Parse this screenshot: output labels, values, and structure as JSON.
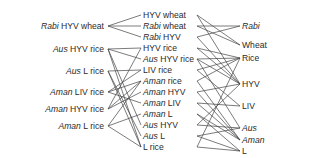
{
  "diagram": {
    "left": [
      {
        "id": "L0",
        "it": "Rabi",
        "rest": " HYV wheat",
        "y": 26
      },
      {
        "id": "L1",
        "it": "Aus",
        "rest": " HYV rice",
        "y": 49
      },
      {
        "id": "L2",
        "it": "Aus",
        "rest": " L rice",
        "y": 71
      },
      {
        "id": "L3",
        "it": "Aman",
        "rest": " LIV rice",
        "y": 92
      },
      {
        "id": "L4",
        "it": "Aman",
        "rest": " HYV rice",
        "y": 109
      },
      {
        "id": "L5",
        "it": "Aman",
        "rest": " L rice",
        "y": 126
      }
    ],
    "middle": [
      {
        "id": "M0",
        "it": "",
        "rest": "HYV wheat",
        "y": 15
      },
      {
        "id": "M1",
        "it": "Rabi",
        "rest": " wheat",
        "y": 26
      },
      {
        "id": "M2",
        "it": "Rabi",
        "rest": " HYV",
        "y": 37
      },
      {
        "id": "M3",
        "it": "",
        "rest": "HYV rice",
        "y": 48
      },
      {
        "id": "M4",
        "it": "Aus",
        "rest": " HYV rice",
        "y": 59
      },
      {
        "id": "M5",
        "it": "",
        "rest": "LIV rice",
        "y": 70
      },
      {
        "id": "M6",
        "it": "Aman",
        "rest": " rice",
        "y": 81
      },
      {
        "id": "M7",
        "it": "Aman",
        "rest": " HYV",
        "y": 92
      },
      {
        "id": "M8",
        "it": "Aman",
        "rest": " LIV",
        "y": 103
      },
      {
        "id": "M9",
        "it": "Aman",
        "rest": " L",
        "y": 114
      },
      {
        "id": "M10",
        "it": "Aus",
        "rest": " HYV",
        "y": 125
      },
      {
        "id": "M11",
        "it": "Aus",
        "rest": " L",
        "y": 136
      },
      {
        "id": "M12",
        "it": "",
        "rest": "L rice",
        "y": 147
      }
    ],
    "right": [
      {
        "id": "R0",
        "it": "Rabi",
        "rest": "",
        "y": 26
      },
      {
        "id": "R1",
        "it": "",
        "rest": "Wheat",
        "y": 45
      },
      {
        "id": "R2",
        "it": "",
        "rest": "Rice",
        "y": 58
      },
      {
        "id": "R3",
        "it": "",
        "rest": "HYV",
        "y": 84
      },
      {
        "id": "R4",
        "it": "",
        "rest": "LIV",
        "y": 106
      },
      {
        "id": "R5",
        "it": "Aus",
        "rest": "",
        "y": 128
      },
      {
        "id": "R6",
        "it": "Aman",
        "rest": "",
        "y": 140
      },
      {
        "id": "R7",
        "it": "",
        "rest": "L",
        "y": 151
      }
    ],
    "left_edges": [
      [
        "L0",
        "M0"
      ],
      [
        "L0",
        "M1"
      ],
      [
        "L0",
        "M2"
      ],
      [
        "L1",
        "M3"
      ],
      [
        "L1",
        "M4"
      ],
      [
        "L1",
        "M10"
      ],
      [
        "L1",
        "M12"
      ],
      [
        "L2",
        "M5"
      ],
      [
        "L2",
        "M11"
      ],
      [
        "L2",
        "M12"
      ],
      [
        "L3",
        "M6"
      ],
      [
        "L3",
        "M8"
      ],
      [
        "L3",
        "M5"
      ],
      [
        "L4",
        "M6"
      ],
      [
        "L4",
        "M7"
      ],
      [
        "L4",
        "M3"
      ],
      [
        "L5",
        "M6"
      ],
      [
        "L5",
        "M9"
      ],
      [
        "L5",
        "M12"
      ]
    ],
    "right_edges": [
      [
        "M0",
        "R1"
      ],
      [
        "M0",
        "R3"
      ],
      [
        "M1",
        "R0"
      ],
      [
        "M1",
        "R1"
      ],
      [
        "M2",
        "R0"
      ],
      [
        "M2",
        "R3"
      ],
      [
        "M3",
        "R2"
      ],
      [
        "M3",
        "R3"
      ],
      [
        "M4",
        "R5"
      ],
      [
        "M4",
        "R3"
      ],
      [
        "M4",
        "R2"
      ],
      [
        "M5",
        "R4"
      ],
      [
        "M5",
        "R2"
      ],
      [
        "M6",
        "R6"
      ],
      [
        "M6",
        "R2"
      ],
      [
        "M7",
        "R6"
      ],
      [
        "M7",
        "R3"
      ],
      [
        "M8",
        "R6"
      ],
      [
        "M8",
        "R4"
      ],
      [
        "M9",
        "R6"
      ],
      [
        "M9",
        "R7"
      ],
      [
        "M10",
        "R5"
      ],
      [
        "M10",
        "R3"
      ],
      [
        "M11",
        "R5"
      ],
      [
        "M11",
        "R7"
      ],
      [
        "M12",
        "R7"
      ],
      [
        "M12",
        "R2"
      ]
    ]
  }
}
